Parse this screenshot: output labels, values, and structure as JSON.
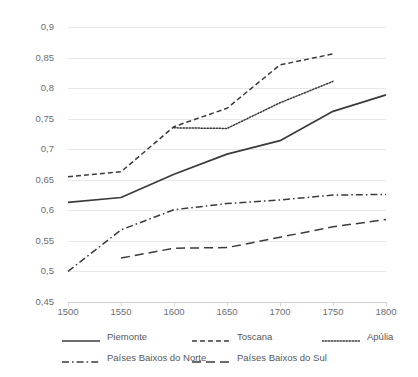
{
  "chart_data": {
    "type": "line",
    "title": "",
    "subtitle": "",
    "xlabel": "",
    "ylabel": "",
    "xlim": [
      1500,
      1800
    ],
    "ylim": [
      0.45,
      0.9
    ],
    "grid": true,
    "legend_position": "bottom",
    "decimal_separator": ",",
    "x_ticks": [
      "1500",
      "1550",
      "1600",
      "1650",
      "1700",
      "1750",
      "1800"
    ],
    "y_ticks": [
      "0,45",
      "0,5",
      "0,55",
      "0,6",
      "0,65",
      "0,7",
      "0,75",
      "0,8",
      "0,85",
      "0,9"
    ],
    "series": [
      {
        "name": "Piemonte",
        "style": "solid",
        "color": "#3b3b3d",
        "x": [
          1500,
          1550,
          1600,
          1650,
          1700,
          1750,
          1800
        ],
        "values": [
          0.613,
          0.621,
          0.659,
          0.692,
          0.714,
          0.762,
          0.789
        ]
      },
      {
        "name": "Toscana",
        "style": "dashed",
        "color": "#3b3b3d",
        "x": [
          1500,
          1550,
          1600,
          1650,
          1700,
          1750
        ],
        "values": [
          0.655,
          0.663,
          0.737,
          0.767,
          0.838,
          0.856
        ]
      },
      {
        "name": "Apúlia",
        "style": "dotted",
        "color": "#3b3b3d",
        "x": [
          1600,
          1650,
          1700,
          1750
        ],
        "values": [
          0.735,
          0.734,
          0.776,
          0.811
        ]
      },
      {
        "name": "Países Baixos do Norte",
        "style": "dash-dot",
        "color": "#3b3b3d",
        "x": [
          1500,
          1550,
          1600,
          1650,
          1700,
          1750,
          1800
        ],
        "values": [
          0.5,
          0.568,
          0.601,
          0.611,
          0.617,
          0.625,
          0.626
        ]
      },
      {
        "name": "Países Baixos do Sul",
        "style": "long-dash",
        "color": "#3b3b3d",
        "x": [
          1550,
          1600,
          1650,
          1700,
          1750,
          1800
        ],
        "values": [
          0.522,
          0.538,
          0.539,
          0.556,
          0.573,
          0.585
        ]
      }
    ]
  },
  "legend": {
    "items": [
      {
        "label": "Piemonte"
      },
      {
        "label": "Toscana"
      },
      {
        "label": "Apúlia"
      },
      {
        "label": "Países Baixos do Norte"
      },
      {
        "label": "Países Baixos do Sul"
      }
    ]
  }
}
